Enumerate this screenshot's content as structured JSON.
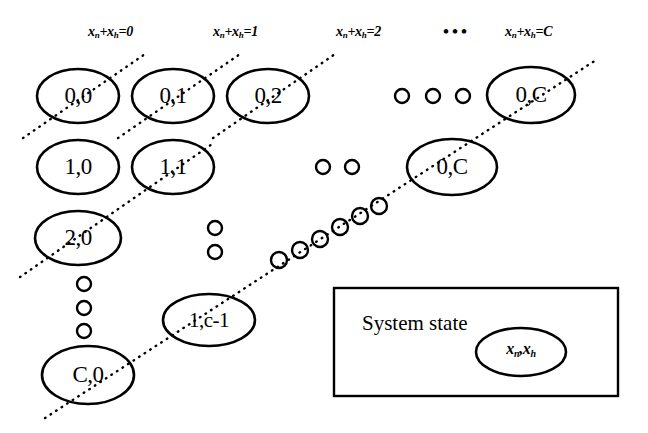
{
  "figure": {
    "type": "state-transition-lattice",
    "background_color": "#ffffff",
    "stroke_color": "#000000"
  },
  "column_headers": [
    {
      "id": "h0",
      "text": "xn+xh=0",
      "base1": "x",
      "sub1": "n",
      "mid": "+",
      "base2": "x",
      "sub2": "h",
      "eq": "=0",
      "x": 88,
      "y": 24
    },
    {
      "id": "h1",
      "text": "xn+xh=1",
      "base1": "x",
      "sub1": "n",
      "mid": "+",
      "base2": "x",
      "sub2": "h",
      "eq": "=1",
      "x": 213,
      "y": 24
    },
    {
      "id": "h2",
      "text": "xn+xh=2",
      "base1": "x",
      "sub1": "n",
      "mid": "+",
      "base2": "x",
      "sub2": "h",
      "eq": "=2",
      "x": 336,
      "y": 24
    },
    {
      "id": "hC",
      "text": "xn+xh=C",
      "base1": "x",
      "sub1": "n",
      "mid": "+",
      "base2": "x",
      "sub2": "h",
      "eq": "=C",
      "x": 505,
      "y": 24
    }
  ],
  "header_ellipsis": {
    "glyph": "•••",
    "x": 443,
    "y": 22
  },
  "nodes": [
    {
      "id": "n00",
      "label": "0,0",
      "cx": 78,
      "cy": 96,
      "rx": 41,
      "ry": 27
    },
    {
      "id": "n01",
      "label": "0,1",
      "cx": 173,
      "cy": 96,
      "rx": 41,
      "ry": 27
    },
    {
      "id": "n02",
      "label": "0,2",
      "cx": 268,
      "cy": 96,
      "rx": 41,
      "ry": 27
    },
    {
      "id": "n0C_t",
      "label": "0,C",
      "cx": 531,
      "cy": 95,
      "rx": 44,
      "ry": 28
    },
    {
      "id": "n10",
      "label": "1,0",
      "cx": 78,
      "cy": 167,
      "rx": 41,
      "ry": 27
    },
    {
      "id": "n11",
      "label": "1,1",
      "cx": 173,
      "cy": 167,
      "rx": 41,
      "ry": 27
    },
    {
      "id": "n0C_b",
      "label": "0,C",
      "cx": 452,
      "cy": 167,
      "rx": 45,
      "ry": 28
    },
    {
      "id": "n20",
      "label": "2,0",
      "cx": 78,
      "cy": 238,
      "rx": 43,
      "ry": 27
    },
    {
      "id": "n1cm1",
      "label": "1,c-1",
      "cx": 209,
      "cy": 320,
      "rx": 46,
      "ry": 26
    },
    {
      "id": "nC0",
      "label": "C,0",
      "cx": 88,
      "cy": 375,
      "rx": 46,
      "ry": 29
    }
  ],
  "small_circles": {
    "row1_horizontal": [
      {
        "cx": 402,
        "cy": 96,
        "r": 7
      },
      {
        "cx": 433,
        "cy": 96,
        "r": 7
      },
      {
        "cx": 463,
        "cy": 96,
        "r": 7
      }
    ],
    "row2_horizontal": [
      {
        "cx": 323,
        "cy": 167,
        "r": 7
      },
      {
        "cx": 352,
        "cy": 167,
        "r": 7
      }
    ],
    "row3_vertical": [
      {
        "cx": 215,
        "cy": 228,
        "r": 7
      },
      {
        "cx": 215,
        "cy": 252,
        "r": 7
      }
    ],
    "col0_vertical": [
      {
        "cx": 84,
        "cy": 284,
        "r": 7
      },
      {
        "cx": 84,
        "cy": 308,
        "r": 7
      },
      {
        "cx": 84,
        "cy": 331,
        "r": 7
      }
    ],
    "diagonal_chain": [
      {
        "cx": 279,
        "cy": 260,
        "r": 8
      },
      {
        "cx": 300,
        "cy": 250,
        "r": 8
      },
      {
        "cx": 320,
        "cy": 239,
        "r": 8
      },
      {
        "cx": 340,
        "cy": 227,
        "r": 8
      },
      {
        "cx": 360,
        "cy": 216,
        "r": 8
      },
      {
        "cx": 379,
        "cy": 206,
        "r": 8
      }
    ]
  },
  "diagonal_lines": [
    {
      "id": "d0",
      "x1": 23,
      "y1": 138,
      "x2": 148,
      "y2": 52
    },
    {
      "id": "d1",
      "x1": 118,
      "y1": 138,
      "x2": 243,
      "y2": 52
    },
    {
      "id": "d2",
      "x1": 213,
      "y1": 138,
      "x2": 338,
      "y2": 52
    },
    {
      "id": "d3",
      "x1": 20,
      "y1": 277,
      "x2": 215,
      "y2": 142
    },
    {
      "id": "dC",
      "x1": 45,
      "y1": 418,
      "x2": 596,
      "y2": 60
    }
  ],
  "legend": {
    "box": {
      "x": 334,
      "y": 288,
      "width": 284,
      "height": 108
    },
    "title": "System state",
    "state_label": {
      "base1": "x",
      "sub1": "n",
      "sep": ",",
      "base2": "x",
      "sub2": "h"
    },
    "state_ellipse": {
      "cx": 521,
      "cy": 352,
      "rx": 45,
      "ry": 24
    }
  }
}
